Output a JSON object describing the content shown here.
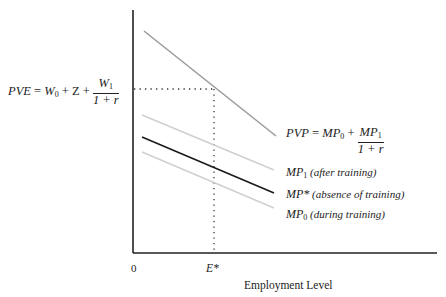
{
  "diagram": {
    "xlabel": "Employment Level",
    "origin_label": "0",
    "e_star_label": "E*",
    "pve": {
      "lhs": "PVE",
      "eq": " = ",
      "w0": "W",
      "w0_sub": "0",
      "plus1": " + Z + ",
      "num": "W",
      "num_sub": "1",
      "den": "1 + r"
    },
    "pvp": {
      "lhs": "PVP",
      "eq": " = ",
      "mp0": "MP",
      "mp0_sub": "0",
      "plus": " + ",
      "num": "MP",
      "num_sub": "1",
      "den": "1 + r"
    },
    "curves": [
      {
        "name": "MP",
        "sub": "1",
        "desc": " (after training)",
        "color": "#cfcfcf"
      },
      {
        "name": "MP*",
        "sub": "",
        "desc": " (absence of training)",
        "color": "#1a1a1a"
      },
      {
        "name": "MP",
        "sub": "0",
        "desc": " (during training)",
        "color": "#cfcfcf"
      }
    ],
    "colors": {
      "axis": "#222222",
      "pvp_line": "#9a9a9a",
      "light_line": "#cfcfcf",
      "dark_line": "#1a1a1a",
      "dotted": "#333333"
    }
  }
}
